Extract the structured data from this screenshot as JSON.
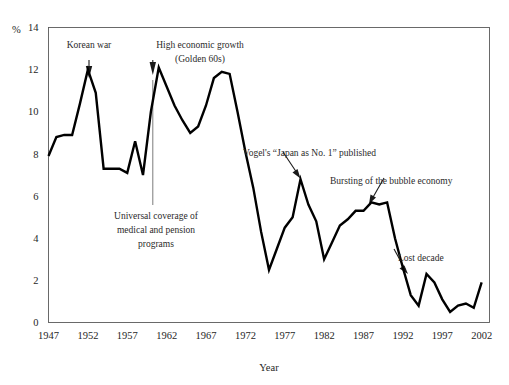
{
  "chart_data": {
    "type": "line",
    "title": "",
    "xlabel": "Year",
    "ylabel": "%",
    "ylim": [
      0,
      14
    ],
    "xlim": [
      1947,
      2003
    ],
    "grid": false,
    "legend": null,
    "ytick_labels": [
      "0",
      "2",
      "4",
      "6",
      "8",
      "10",
      "12",
      "14"
    ],
    "ytick_values": [
      0,
      2,
      4,
      6,
      8,
      10,
      12,
      14
    ],
    "xtick_labels": [
      "1947",
      "1952",
      "1957",
      "1962",
      "1967",
      "1972",
      "1977",
      "1982",
      "1987",
      "1992",
      "1997",
      "2002"
    ],
    "xtick_values": [
      1947,
      1952,
      1957,
      1962,
      1967,
      1972,
      1977,
      1982,
      1987,
      1992,
      1997,
      2002
    ],
    "series": [
      {
        "name": "Growth rate",
        "color": "#000000",
        "x": [
          1947,
          1948,
          1949,
          1950,
          1951,
          1952,
          1953,
          1954,
          1955,
          1956,
          1957,
          1958,
          1959,
          1960,
          1961,
          1962,
          1963,
          1964,
          1965,
          1966,
          1967,
          1968,
          1969,
          1970,
          1971,
          1972,
          1973,
          1974,
          1975,
          1976,
          1977,
          1978,
          1979,
          1980,
          1981,
          1982,
          1983,
          1984,
          1985,
          1986,
          1987,
          1988,
          1989,
          1990,
          1991,
          1992,
          1993,
          1994,
          1995,
          1996,
          1997,
          1998,
          1999,
          2000,
          2001,
          2002
        ],
        "values": [
          7.9,
          8.8,
          8.9,
          8.9,
          10.4,
          12.0,
          10.9,
          7.3,
          7.3,
          7.3,
          7.1,
          8.6,
          7.0,
          10.0,
          12.1,
          11.2,
          10.3,
          9.6,
          9.0,
          9.3,
          10.3,
          11.6,
          11.9,
          11.8,
          10.0,
          8.1,
          6.4,
          4.3,
          2.5,
          3.5,
          4.5,
          5.0,
          6.8,
          5.6,
          4.8,
          3.0,
          3.8,
          4.6,
          4.9,
          5.3,
          5.3,
          5.7,
          5.6,
          5.7,
          4.0,
          2.6,
          1.3,
          0.8,
          2.3,
          1.9,
          1.1,
          0.5,
          0.8,
          0.9,
          0.7,
          1.9
        ]
      }
    ],
    "annotations": [
      {
        "id": "korean-war",
        "text": "Korean war",
        "pointer": "arrow-down",
        "points_to_year": 1952,
        "points_to_value": 12.0
      },
      {
        "id": "high-economic-growth",
        "text_line1": "High economic growth",
        "text_line2": "(Golden 60s)",
        "pointer": "arrow-down",
        "points_to_year": 1961,
        "points_to_value": 12.1
      },
      {
        "id": "universal-coverage",
        "text_line1": "Universal coverage of",
        "text_line2": "medical and pension",
        "text_line3": "programs",
        "pointer": "vertical-line",
        "points_to_year": 1961,
        "points_to_value": 12.1
      },
      {
        "id": "vogel-japan-as-no1",
        "text": "Vogel's “Japan as No. 1” published",
        "pointer": "arrow",
        "points_to_year": 1979,
        "points_to_value": 6.8
      },
      {
        "id": "bursting-bubble",
        "text": "Bursting of the bubble economy",
        "pointer": "arrow",
        "points_to_year": 1990,
        "points_to_value": 5.7
      },
      {
        "id": "lost-decade",
        "text": "Lost decade",
        "pointer": "arrow",
        "points_to_year": 1995,
        "points_to_value": 2.3
      }
    ]
  }
}
